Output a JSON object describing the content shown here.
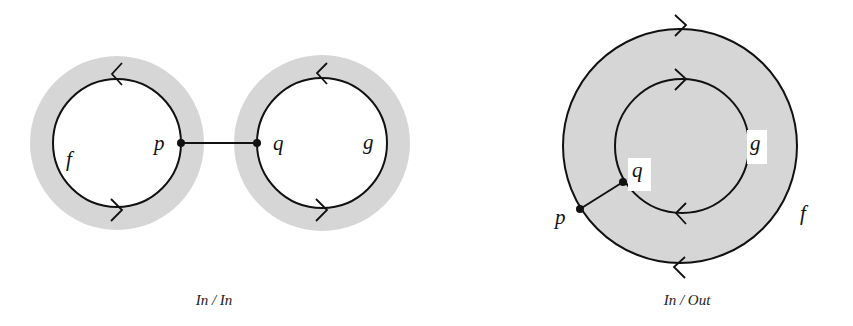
{
  "figure": {
    "colors": {
      "background": "#ffffff",
      "band": "#d6d6d6",
      "stroke": "#111111"
    },
    "left_panel": {
      "caption": "In / In",
      "circles": [
        {
          "label": "f",
          "cx": 117,
          "cy": 143,
          "r": 64,
          "band_r": 87,
          "top_arrow": "left",
          "bottom_arrow": "right"
        },
        {
          "label": "g",
          "cx": 322,
          "cy": 143,
          "r": 65,
          "band_r": 88,
          "top_arrow": "left",
          "bottom_arrow": "right"
        }
      ],
      "points": [
        {
          "label": "p",
          "x": 181,
          "y": 143
        },
        {
          "label": "q",
          "x": 257,
          "y": 143
        }
      ]
    },
    "right_panel": {
      "caption": "In / Out",
      "circles": [
        {
          "label": "f",
          "cx": 680,
          "cy": 146,
          "r": 117,
          "top_arrow": "right",
          "bottom_arrow": "left"
        },
        {
          "label": "g",
          "cx": 682,
          "cy": 146,
          "r": 67,
          "top_arrow": "right",
          "bottom_arrow": "left"
        }
      ],
      "points": [
        {
          "label": "p",
          "x": 580,
          "y": 209
        },
        {
          "label": "q",
          "x": 623,
          "y": 182
        }
      ]
    }
  }
}
